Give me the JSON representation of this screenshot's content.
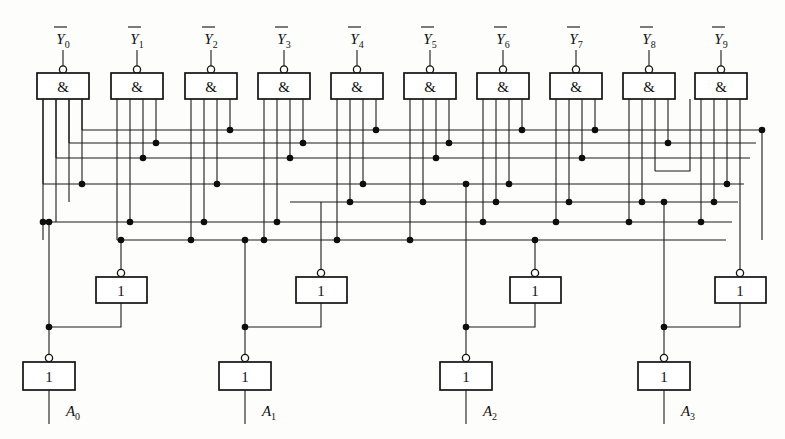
{
  "figure": {
    "type": "logic-circuit-diagram",
    "background_color": "#fdfdfc",
    "line_color": "#1a1a1a"
  },
  "outputs": {
    "count": 10,
    "labels": [
      "Y0",
      "Y1",
      "Y2",
      "Y3",
      "Y4",
      "Y5",
      "Y6",
      "Y7",
      "Y8",
      "Y9"
    ],
    "base": "Y",
    "subscripts": [
      "0",
      "1",
      "2",
      "3",
      "4",
      "5",
      "6",
      "7",
      "8",
      "9"
    ],
    "overbar": true
  },
  "inputs": {
    "count": 4,
    "labels": [
      "A0",
      "A1",
      "A2",
      "A3"
    ],
    "base": "A",
    "subscripts": [
      "0",
      "1",
      "2",
      "3"
    ]
  },
  "nand_gates": {
    "count": 10,
    "symbol": "&",
    "inputs_per_gate": 4,
    "inverted_output": true,
    "centers_x": [
      63,
      137,
      211,
      284,
      357,
      430,
      503,
      576,
      649,
      721
    ],
    "box": {
      "width": 52,
      "height": 26,
      "top": 73
    },
    "pin_offsets": [
      -20,
      -7,
      6,
      19
    ]
  },
  "buffer_inverters": {
    "count": 4,
    "symbol": "1",
    "inverted_output": true,
    "centers_x": [
      121,
      321,
      535,
      740
    ],
    "box": {
      "width": 51,
      "height": 26,
      "top": 277
    }
  },
  "input_inverters": {
    "count": 4,
    "symbol": "1",
    "inverted_output": true,
    "centers_x": [
      49,
      245,
      466,
      664
    ],
    "box": {
      "width": 52,
      "height": 28,
      "top": 362
    }
  },
  "bus_rows_y": [
    130,
    143,
    158,
    171,
    184,
    202,
    222,
    240
  ],
  "icons": {
    "inversion_bubble": "bubble-icon",
    "junction_dot": "junction-dot-icon"
  }
}
